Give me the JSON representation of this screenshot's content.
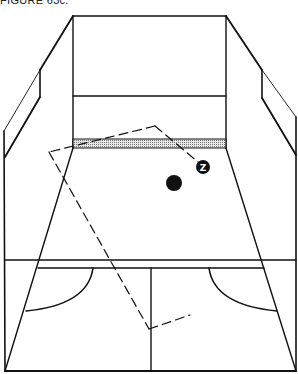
{
  "caption": "FIGURE 63c.",
  "diagram": {
    "colors": {
      "line": "#111111",
      "tin_fill": "#bdbdbd",
      "background": "#ffffff"
    },
    "markers": [
      {
        "id": "player-z",
        "label": "Z",
        "shape": "filled-circle-with-letter",
        "cx": 203,
        "cy": 167,
        "r": 7
      },
      {
        "id": "ball",
        "label": "",
        "shape": "filled-circle",
        "cx": 174,
        "cy": 183,
        "r": 8
      }
    ],
    "zones": [
      {
        "id": "target-zone",
        "style": "dashed-rectangle",
        "corners": [
          [
            155,
            126
          ],
          [
            49,
            152
          ],
          [
            149,
            329
          ],
          [
            190,
            315
          ]
        ]
      }
    ],
    "elements": [
      "front wall",
      "tin band",
      "side walls",
      "short line",
      "half-court line",
      "service boxes",
      "back wall line"
    ]
  }
}
